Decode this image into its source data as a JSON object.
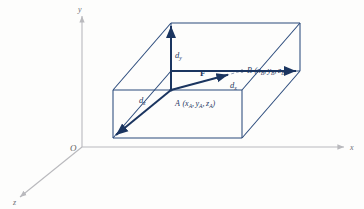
{
  "figure": {
    "colors": {
      "box_line": "#2a4a7b",
      "vector": "#1b3560",
      "axis": "#b9b9bd",
      "axis_label": "#6f6f74",
      "background": "#fdfdfc",
      "dashed": "#6a7fa0"
    },
    "axes": {
      "y_label": "y",
      "x_label": "x",
      "z_label": "z",
      "origin_label": "O"
    },
    "points": [
      {
        "id": "A",
        "name": "A",
        "coords_text": "(xₐ, yₐ, zₐ)",
        "letter": "A",
        "open_paren": "(",
        "comp_x": "x",
        "comp_y": "y",
        "comp_z": "z",
        "sub": "A",
        "close_paren": ")"
      },
      {
        "id": "B",
        "name": "B",
        "coords_text": "(x_B, y_B, z_B)",
        "letter": "B",
        "open_paren": "(",
        "comp_x": "x",
        "comp_y": "y",
        "comp_z": "z",
        "sub": "B",
        "close_paren": ")"
      }
    ],
    "vector": {
      "label": "F",
      "from": "A",
      "to": "B"
    },
    "components": [
      {
        "id": "dy",
        "base": "d",
        "sub": "y",
        "label": "d_y",
        "axis": "y"
      },
      {
        "id": "dx",
        "base": "d",
        "sub": "x",
        "label": "d_x",
        "axis": "x"
      },
      {
        "id": "dz",
        "base": "d",
        "sub": "z",
        "label": "d_z",
        "axis": "z"
      }
    ]
  }
}
